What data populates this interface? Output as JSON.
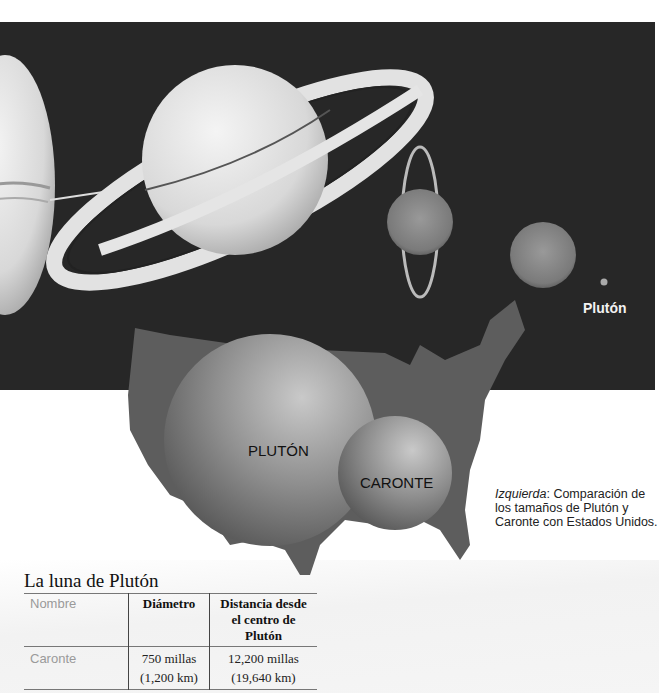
{
  "illustration": {
    "planet_label": "Plutón",
    "sphere_labels": {
      "pluto": "PLUTÓN",
      "charon": "CARONTE"
    }
  },
  "caption": {
    "lead": "Izquierda",
    "text": ":  Comparación de los tamaños de Plutón y Caronte con Estados Unidos."
  },
  "table": {
    "title": "La luna de Plutón",
    "headers": [
      "Nombre",
      "Diámetro",
      "Distancia desde el centro de Plutón"
    ],
    "rows": [
      {
        "name": "Caronte",
        "diameter": [
          "750 millas",
          "(1,200 km)"
        ],
        "distance": [
          "12,200 millas",
          "(19,640 km)"
        ]
      }
    ]
  }
}
